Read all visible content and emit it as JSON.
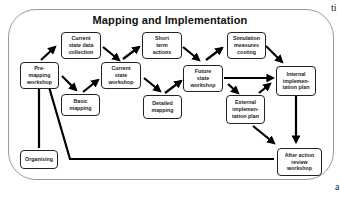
{
  "diagram": {
    "title": "Mapping and Implementation",
    "stray_text": {
      "top_right": "ti",
      "bottom_right": "a"
    },
    "nodes": [
      {
        "id": "pre-mapping-workshop",
        "label": "Pre-\nmapping\nworkshop"
      },
      {
        "id": "current-state-data-collection",
        "label": "Current\nstate data\ncollection"
      },
      {
        "id": "basic-mapping",
        "label": "Basic\nmapping"
      },
      {
        "id": "current-state-workshop",
        "label": "Current\nstate\nworkshop"
      },
      {
        "id": "short-term-actions",
        "label": "Short\nterm\nactions"
      },
      {
        "id": "detailed-mapping",
        "label": "Detailed\nmapping"
      },
      {
        "id": "future-state-workshop",
        "label": "Future\nstate\nworkshop"
      },
      {
        "id": "simulation-measures-costing",
        "label": "Simulation\nmeasures\ncosting"
      },
      {
        "id": "external-implementation-plan",
        "label": "External\nimplemen-\ntation plan"
      },
      {
        "id": "internal-implementation-plan",
        "label": "Internal\nimplemen-\ntation plan"
      },
      {
        "id": "organising",
        "label": "Organising"
      },
      {
        "id": "after-action-review-workshop",
        "label": "After action\nreview\nworkshop"
      }
    ],
    "edges": [
      {
        "from": "pre-mapping-workshop",
        "to": "current-state-data-collection"
      },
      {
        "from": "pre-mapping-workshop",
        "to": "basic-mapping"
      },
      {
        "from": "current-state-data-collection",
        "to": "current-state-workshop"
      },
      {
        "from": "basic-mapping",
        "to": "current-state-workshop"
      },
      {
        "from": "current-state-workshop",
        "to": "short-term-actions"
      },
      {
        "from": "current-state-workshop",
        "to": "detailed-mapping"
      },
      {
        "from": "short-term-actions",
        "to": "future-state-workshop"
      },
      {
        "from": "detailed-mapping",
        "to": "future-state-workshop"
      },
      {
        "from": "future-state-workshop",
        "to": "simulation-measures-costing"
      },
      {
        "from": "future-state-workshop",
        "to": "internal-implementation-plan"
      },
      {
        "from": "future-state-workshop",
        "to": "external-implementation-plan"
      },
      {
        "from": "external-implementation-plan",
        "to": "internal-implementation-plan"
      },
      {
        "from": "simulation-measures-costing",
        "to": "internal-implementation-plan"
      },
      {
        "from": "internal-implementation-plan",
        "to": "after-action-review-workshop"
      },
      {
        "from": "external-implementation-plan",
        "to": "after-action-review-workshop"
      },
      {
        "from": "organising",
        "to": "pre-mapping-workshop"
      },
      {
        "from": "after-action-review-workshop",
        "to": "pre-mapping-workshop"
      }
    ]
  }
}
